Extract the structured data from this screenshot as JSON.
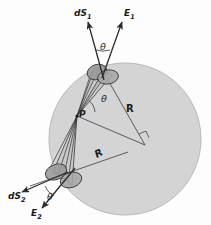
{
  "figure": {
    "background_color": "#fdfdfd",
    "sphere": {
      "name": "sphere",
      "fill_color": "#d4d4d4",
      "stroke_color": "#b4b4b4",
      "center_x": 125,
      "center_y": 139,
      "radius": 76
    },
    "point": {
      "label": "P",
      "x": 77,
      "y": 116
    },
    "labels": {
      "dS1": "dS",
      "dS1_sub": "1",
      "dS2": "dS",
      "dS2_sub": "2",
      "E1": "E",
      "E1_sub": "1",
      "E2": "E",
      "E2_sub": "2",
      "theta_top": "θ",
      "theta_center": "θ",
      "theta_bottom": "θ",
      "R_radius": "R",
      "script_R": "R",
      "P": "P"
    },
    "caps": {
      "top_cap_fill": "#9f9f9f",
      "top_cap_stroke": "#4a4a4a",
      "bottom_cap_fill": "#9f9f9f",
      "bottom_cap_stroke": "#4a4a4a",
      "cone_fill": "#c2c2c2",
      "cone_stroke": "#3a3a3a"
    },
    "line_color": "#2b2b2b"
  }
}
